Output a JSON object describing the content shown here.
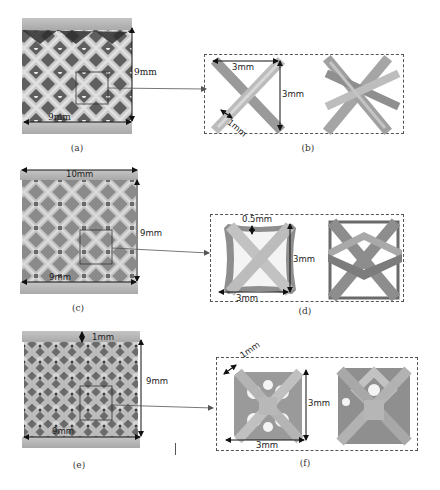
{
  "figure": {
    "panels": [
      {
        "id": "a",
        "caption": "(a)",
        "type": "lattice-overview",
        "dimensions": {
          "height": "9mm",
          "width": "9mm"
        }
      },
      {
        "id": "b",
        "caption": "(b)",
        "type": "unit-cell-detail",
        "dimensions": {
          "width": "3mm",
          "height": "3mm",
          "strut": "1mm"
        }
      },
      {
        "id": "c",
        "caption": "(c)",
        "type": "lattice-overview",
        "dimensions": {
          "top_width": "10mm",
          "height": "9mm",
          "width": "9mm"
        }
      },
      {
        "id": "d",
        "caption": "(d)",
        "type": "unit-cell-detail",
        "dimensions": {
          "wall": "0.5mm",
          "height": "3mm",
          "width": "3mm"
        }
      },
      {
        "id": "e",
        "caption": "(e)",
        "type": "lattice-overview",
        "dimensions": {
          "plate": "1mm",
          "height": "9mm",
          "width": "9mm"
        }
      },
      {
        "id": "f",
        "caption": "(f)",
        "type": "unit-cell-detail",
        "dimensions": {
          "strut": "1mm",
          "height": "3mm",
          "width": "3mm"
        }
      }
    ],
    "colors": {
      "plate": "#b9b9b9",
      "strut_light": "#d2d2d2",
      "strut_mid": "#a8a8a8",
      "strut_dark": "#6e6e6e",
      "shadow": "#3a3a3a",
      "annotation": "#111111",
      "dashed_border": "#555555"
    }
  }
}
